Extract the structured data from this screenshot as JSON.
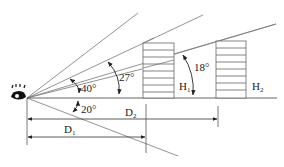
{
  "diagram": {
    "angles": {
      "a40": "40°",
      "a27": "27°",
      "a18": "18°",
      "a20": "20°"
    },
    "labels": {
      "h1_main": "H",
      "h1_sub": "1",
      "h2_main": "H",
      "h2_sub": "2",
      "d1_main": "D",
      "d1_sub": "1",
      "d2_main": "D",
      "d2_sub": "2"
    },
    "icons": {
      "eye": "eye-icon"
    },
    "colors": {
      "line": "#555555",
      "text": "#222222"
    }
  }
}
